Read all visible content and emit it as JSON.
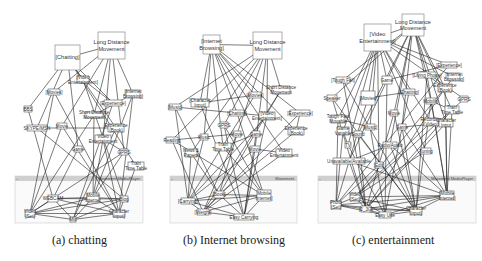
{
  "figure": {
    "panels": [
      {
        "id": "a",
        "caption": "(a) chatting",
        "window_title": "Movement MediaPlayer",
        "top_nodes": [
          {
            "label_lines": [
              "[Chatting]"
            ],
            "x": 55,
            "y": 45,
            "w": 25,
            "h": 25,
            "big": true
          },
          {
            "label_lines": [
              "Long Distance",
              "Movement"
            ],
            "x": 98,
            "y": 32,
            "w": 27,
            "h": 27,
            "big": true
          },
          {
            "label_lines": [
              "[Video",
              "Entertainment]"
            ],
            "x": 77,
            "y": 76,
            "w": 12,
            "h": 7
          },
          {
            "label_lines": [
              "[Movies]"
            ],
            "x": 48,
            "y": 89,
            "w": 12,
            "h": 6
          },
          {
            "label_lines": [
              "[Experience]"
            ],
            "x": 104,
            "y": 100,
            "w": 18,
            "h": 6
          },
          {
            "label_lines": [
              "[Internet",
              "Browsing]"
            ],
            "x": 126,
            "y": 90,
            "w": 14,
            "h": 8
          },
          {
            "label_lines": [
              "BBS"
            ],
            "x": 24,
            "y": 106,
            "w": 8,
            "h": 6
          },
          {
            "label_lines": [
              "Short Distance",
              "Movement"
            ],
            "x": 85,
            "y": 112,
            "w": 18,
            "h": 6
          },
          {
            "label_lines": [
              "SKYPE/MSN"
            ],
            "x": 27,
            "y": 125,
            "w": 20,
            "h": 6
          },
          {
            "label_lines": [
              "Movie"
            ],
            "x": 57,
            "y": 123,
            "w": 10,
            "h": 6
          },
          {
            "label_lines": [
              "Experience",
              "(Book)"
            ],
            "x": 108,
            "y": 124,
            "w": 16,
            "h": 8
          },
          {
            "label_lines": [
              "Video",
              "Entertainment"
            ],
            "x": 95,
            "y": 135,
            "w": 16,
            "h": 8
          },
          {
            "label_lines": [
              "Game"
            ],
            "x": 74,
            "y": 146,
            "w": 8,
            "h": 6
          },
          {
            "label_lines": [
              "GPRS"
            ],
            "x": 120,
            "y": 149,
            "w": 8,
            "h": 6
          },
          {
            "label_lines": [
              "Train",
              "Time Table"
            ],
            "x": 128,
            "y": 162,
            "w": 16,
            "h": 8
          }
        ],
        "window": {
          "x": 15,
          "y": 176,
          "w": 128,
          "h": 47
        },
        "window_nodes": [
          {
            "label_lines": [
              "WEBCAM"
            ],
            "x": 48,
            "y": 195,
            "w": 10,
            "h": 7
          },
          {
            "label_lines": [
              "Mobile",
              "Internet"
            ],
            "x": 87,
            "y": 193,
            "w": 12,
            "h": 9
          },
          {
            "label_lines": [
              "Blog"
            ],
            "x": 120,
            "y": 196,
            "w": 8,
            "h": 6
          },
          {
            "label_lines": [
              "Video",
              "[Set]"
            ],
            "x": 25,
            "y": 210,
            "w": 10,
            "h": 7
          },
          {
            "label_lines": [
              "Mic"
            ],
            "x": 70,
            "y": 217,
            "w": 6,
            "h": 5
          },
          {
            "label_lines": [
              "Character",
              "Input]"
            ],
            "x": 113,
            "y": 210,
            "w": 12,
            "h": 7
          }
        ]
      },
      {
        "id": "b",
        "caption": "(b) Internet browsing",
        "window_title": "Movement",
        "top_nodes": [
          {
            "label_lines": [
              "[Internet",
              "Browsing]"
            ],
            "x": 203,
            "y": 35,
            "w": 17,
            "h": 19,
            "big": true
          },
          {
            "label_lines": [
              "Long Distance",
              "Movement"
            ],
            "x": 253,
            "y": 32,
            "w": 29,
            "h": 27,
            "big": true
          },
          {
            "label_lines": [
              "[Movies]"
            ],
            "x": 249,
            "y": 92,
            "w": 12,
            "h": 6
          },
          {
            "label_lines": [
              "Short Distance",
              "Movement"
            ],
            "x": 272,
            "y": 86,
            "w": 18,
            "h": 8
          },
          {
            "label_lines": [
              "[Character",
              "Input]"
            ],
            "x": 191,
            "y": 99,
            "w": 18,
            "h": 8
          },
          {
            "label_lines": [
              "[Music]"
            ],
            "x": 169,
            "y": 104,
            "w": 12,
            "h": 6
          },
          {
            "label_lines": [
              "[Chatting]"
            ],
            "x": 230,
            "y": 110,
            "w": 14,
            "h": 6
          },
          {
            "label_lines": [
              "[Video",
              "Entertainment]"
            ],
            "x": 259,
            "y": 112,
            "w": 16,
            "h": 8
          },
          {
            "label_lines": [
              "[Experience]"
            ],
            "x": 290,
            "y": 110,
            "w": 20,
            "h": 6
          },
          {
            "label_lines": [
              "GPRS"
            ],
            "x": 220,
            "y": 122,
            "w": 8,
            "h": 6
          },
          {
            "label_lines": [
              "Experience",
              "(Book)"
            ],
            "x": 288,
            "y": 127,
            "w": 16,
            "h": 8
          },
          {
            "label_lines": [
              "Reading"
            ],
            "x": 166,
            "y": 137,
            "w": 12,
            "h": 6
          },
          {
            "label_lines": [
              "Music"
            ],
            "x": 200,
            "y": 134,
            "w": 8,
            "h": 6
          },
          {
            "label_lines": [
              "Movie"
            ],
            "x": 233,
            "y": 131,
            "w": 8,
            "h": 6
          },
          {
            "label_lines": [
              "Game"
            ],
            "x": 252,
            "y": 131,
            "w": 8,
            "h": 6
          },
          {
            "label_lines": [
              "News &",
              "Papers"
            ],
            "x": 185,
            "y": 149,
            "w": 12,
            "h": 8
          },
          {
            "label_lines": [
              "Train",
              "Time Table"
            ],
            "x": 215,
            "y": 143,
            "w": 16,
            "h": 8
          },
          {
            "label_lines": [
              "Movie"
            ],
            "x": 250,
            "y": 146,
            "w": 10,
            "h": 6
          },
          {
            "label_lines": [
              "Video",
              "Entertainment"
            ],
            "x": 276,
            "y": 149,
            "w": 16,
            "h": 8
          }
        ],
        "window": {
          "x": 170,
          "y": 176,
          "w": 127,
          "h": 47
        },
        "window_nodes": [
          {
            "label_lines": [
              "[Book]"
            ],
            "x": 214,
            "y": 191,
            "w": 10,
            "h": 7
          },
          {
            "label_lines": [
              "Mobile",
              "Internet]"
            ],
            "x": 257,
            "y": 190,
            "w": 14,
            "h": 11
          },
          {
            "label_lines": [
              "[Carrying]"
            ],
            "x": 181,
            "y": 198,
            "w": 14,
            "h": 6
          },
          {
            "label_lines": [
              "[Weight]"
            ],
            "x": 197,
            "y": 209,
            "w": 12,
            "h": 6
          },
          {
            "label_lines": [
              "Easy Carrying"
            ],
            "x": 234,
            "y": 214,
            "w": 20,
            "h": 6
          }
        ]
      },
      {
        "id": "c",
        "caption": "(c) entertainment",
        "window_title": "Movement MediaPlayer",
        "top_nodes": [
          {
            "label_lines": [
              "[Video",
              "Entertainment]"
            ],
            "x": 364,
            "y": 24,
            "w": 27,
            "h": 27,
            "big": true
          },
          {
            "label_lines": [
              "Long Distance",
              "Movement"
            ],
            "x": 402,
            "y": 14,
            "w": 22,
            "h": 22,
            "big": true
          },
          {
            "label_lines": [
              "[Experience]"
            ],
            "x": 441,
            "y": 62,
            "w": 16,
            "h": 6
          },
          {
            "label_lines": [
              "[Tough Fall]"
            ],
            "x": 336,
            "y": 77,
            "w": 14,
            "h": 6
          },
          {
            "label_lines": [
              "Game"
            ],
            "x": 382,
            "y": 76,
            "w": 10,
            "h": 8
          },
          {
            "label_lines": [
              "[Living Phone]"
            ],
            "x": 418,
            "y": 72,
            "w": 18,
            "h": 6
          },
          {
            "label_lines": [
              "[Internet",
              "Browsing]"
            ],
            "x": 448,
            "y": 73,
            "w": 12,
            "h": 8
          },
          {
            "label_lines": [
              "Experience",
              "(Book)"
            ],
            "x": 438,
            "y": 84,
            "w": 14,
            "h": 8
          },
          {
            "label_lines": [
              "[Movies]"
            ],
            "x": 361,
            "y": 91,
            "w": 14,
            "h": 14,
            "big": false
          },
          {
            "label_lines": [
              "Speaker"
            ],
            "x": 327,
            "y": 95,
            "w": 10,
            "h": 6
          },
          {
            "label_lines": [
              "[Chatting]"
            ],
            "x": 403,
            "y": 89,
            "w": 12,
            "h": 6
          },
          {
            "label_lines": [
              "Mobility"
            ],
            "x": 426,
            "y": 98,
            "w": 10,
            "h": 6
          },
          {
            "label_lines": [
              "GPRS"
            ],
            "x": 460,
            "y": 96,
            "w": 8,
            "h": 6
          },
          {
            "label_lines": [
              "Train",
              "Time Table"
            ],
            "x": 445,
            "y": 106,
            "w": 14,
            "h": 8
          },
          {
            "label_lines": [
              "Tough Fast",
              "Movable"
            ],
            "x": 331,
            "y": 115,
            "w": 14,
            "h": 8
          },
          {
            "label_lines": [
              "Movie"
            ],
            "x": 390,
            "y": 110,
            "w": 8,
            "h": 6
          },
          {
            "label_lines": [
              "[Music]"
            ],
            "x": 365,
            "y": 124,
            "w": 10,
            "h": 6
          },
          {
            "label_lines": [
              "Game"
            ],
            "x": 398,
            "y": 124,
            "w": 8,
            "h": 6
          },
          {
            "label_lines": [
              "Recording",
              "Video"
            ],
            "x": 424,
            "y": 118,
            "w": 14,
            "h": 8
          },
          {
            "label_lines": [
              "Character",
              "Input"
            ],
            "x": 439,
            "y": 119,
            "w": 14,
            "h": 8
          },
          {
            "label_lines": [
              "Game",
              "Variable"
            ],
            "x": 337,
            "y": 127,
            "w": 12,
            "h": 8
          },
          {
            "label_lines": [
              "Sound"
            ],
            "x": 354,
            "y": 131,
            "w": 8,
            "h": 6
          },
          {
            "label_lines": [
              "TV"
            ],
            "x": 345,
            "y": 142,
            "w": 6,
            "h": 6
          },
          {
            "label_lines": [
              "Radio/Audio"
            ],
            "x": 383,
            "y": 142,
            "w": 14,
            "h": 6
          },
          {
            "label_lines": [
              "Tuning"
            ],
            "x": 421,
            "y": 148,
            "w": 10,
            "h": 6
          },
          {
            "label_lines": [
              "Unavailable/Available"
            ],
            "x": 333,
            "y": 158,
            "w": 32,
            "h": 6
          },
          {
            "label_lines": [
              "[Edit]"
            ],
            "x": 375,
            "y": 162,
            "w": 8,
            "h": 6
          }
        ],
        "window": {
          "x": 318,
          "y": 176,
          "w": 158,
          "h": 47
        },
        "window_nodes": [
          {
            "label_lines": [
              "Video",
              "[Set]"
            ],
            "x": 350,
            "y": 193,
            "w": 10,
            "h": 8
          },
          {
            "label_lines": [
              "[Mobile",
              "Internet]"
            ],
            "x": 440,
            "y": 191,
            "w": 14,
            "h": 9
          },
          {
            "label_lines": [
              "Photo",
              "[Set]"
            ],
            "x": 331,
            "y": 201,
            "w": 10,
            "h": 8
          },
          {
            "label_lines": [
              "[2_3G]"
            ],
            "x": 361,
            "y": 206,
            "w": 10,
            "h": 6
          },
          {
            "label_lines": [
              "Easy Use"
            ],
            "x": 379,
            "y": 212,
            "w": 12,
            "h": 6
          },
          {
            "label_lines": [
              "Character",
              "Input]"
            ],
            "x": 410,
            "y": 207,
            "w": 12,
            "h": 8
          }
        ]
      }
    ]
  }
}
